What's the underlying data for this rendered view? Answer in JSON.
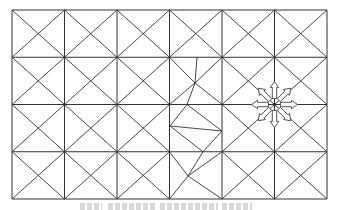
{
  "figure": {
    "type": "triangulated grid mesh with local deformation and node displacement arrows",
    "grid": {
      "columns": 6,
      "rows": 4,
      "x_lines": [
        12,
        64.5,
        117,
        169.5,
        222,
        274.5,
        327
      ],
      "y_lines": [
        10,
        57.25,
        104.5,
        151.75,
        199
      ],
      "stroke_color": "#333333",
      "cell_pattern": "cross-diagonals"
    },
    "deformed_region": {
      "column_index": 3,
      "description": "mesh lines in column 4 (rows 2-4) are distorted into an irregular fracture-like polyline",
      "segments": [
        [
          [
            197,
            57.25
          ],
          [
            195,
            83
          ]
        ],
        [
          [
            195,
            83
          ],
          [
            187,
            104.5
          ]
        ],
        [
          [
            169.5,
            57.25
          ],
          [
            195,
            83
          ]
        ],
        [
          [
            222,
            57.25
          ],
          [
            195,
            83
          ]
        ],
        [
          [
            195,
            83
          ],
          [
            222,
            104.5
          ]
        ],
        [
          [
            169.5,
            104.5
          ],
          [
            195,
            83
          ]
        ],
        [
          [
            187,
            104.5
          ],
          [
            170,
            126
          ]
        ],
        [
          [
            187,
            104.5
          ],
          [
            222,
            131
          ]
        ],
        [
          [
            170,
            126
          ],
          [
            222,
            131
          ]
        ],
        [
          [
            170,
            126
          ],
          [
            203,
            151.75
          ]
        ],
        [
          [
            222,
            131
          ],
          [
            203,
            151.75
          ]
        ],
        [
          [
            169.5,
            151.75
          ],
          [
            188,
            176
          ]
        ],
        [
          [
            203,
            151.75
          ],
          [
            188,
            176
          ]
        ],
        [
          [
            222,
            151.75
          ],
          [
            188,
            176
          ]
        ],
        [
          [
            188,
            176
          ],
          [
            169.5,
            199
          ]
        ],
        [
          [
            188,
            176
          ],
          [
            222,
            199
          ]
        ]
      ]
    },
    "arrow_star": {
      "center": [
        274.5,
        104.5
      ],
      "count": 8,
      "directions_deg": [
        0,
        45,
        90,
        135,
        180,
        225,
        270,
        315
      ],
      "inner_radius": 6,
      "outer_radius": 23,
      "style": "hollow block arrows pointing outward",
      "stroke_color": "#444444"
    },
    "caption": {
      "visible": true,
      "legible": false,
      "color": "#c8c8c8",
      "blocks": [
        {
          "x": 80,
          "w": 22
        },
        {
          "x": 108,
          "w": 48
        },
        {
          "x": 160,
          "w": 58
        },
        {
          "x": 222,
          "w": 30
        }
      ]
    }
  }
}
